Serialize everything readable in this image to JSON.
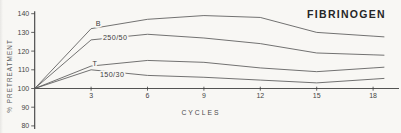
{
  "chart_data": {
    "type": "line",
    "title": "FIBRINOGEN",
    "xlabel": "CYCLES",
    "ylabel": "% PRETREATMENT",
    "x": [
      0,
      3,
      6,
      9,
      12,
      15,
      18
    ],
    "x_ticks": [
      3,
      6,
      9,
      12,
      15,
      18
    ],
    "y_ticks": [
      80,
      90,
      100,
      110,
      120,
      130,
      140
    ],
    "xlim": [
      0,
      19.4
    ],
    "ylim": [
      80,
      140
    ],
    "baseline": 100,
    "grid": false,
    "legend_position": "inline-labels",
    "series": [
      {
        "name": "B",
        "values": [
          100,
          132,
          137,
          139,
          138,
          130,
          128
        ],
        "label_anchor": {
          "cycle": 3.25,
          "value": 134.5
        }
      },
      {
        "name": "250/50",
        "values": [
          100,
          126,
          129,
          127,
          124,
          119,
          118
        ],
        "label_anchor": {
          "cycle": 3.63,
          "value": 127.5
        }
      },
      {
        "name": "T",
        "values": [
          100,
          112,
          115,
          114,
          111,
          109,
          111
        ],
        "label_anchor": {
          "cycle": 3.08,
          "value": 113.2
        }
      },
      {
        "name": "150/30",
        "values": [
          100,
          110,
          107,
          106,
          104.5,
          103,
          105
        ],
        "label_anchor": {
          "cycle": 3.47,
          "value": 107.5
        }
      }
    ]
  },
  "colors": {
    "background": "#f8f7f4",
    "axis": "#3f3f3f",
    "series_line": "#565656",
    "tick_text": "#454545",
    "title_text": "#262626",
    "series_label_text": "#3c3c3c",
    "axis_label_text": "#5a5a5a"
  }
}
